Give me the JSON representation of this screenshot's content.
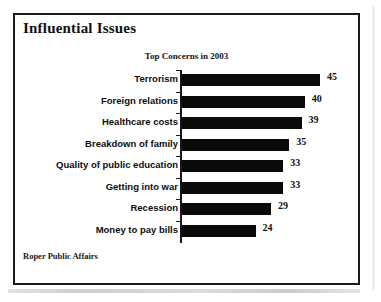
{
  "frame": {
    "panel_title": "Influential Issues",
    "source_note": "Roper Public Affairs"
  },
  "chart_data": {
    "type": "bar",
    "orientation": "horizontal",
    "title": "Top Concerns in 2003",
    "subtitle": "",
    "xlabel": "",
    "ylabel": "",
    "xlim": [
      0,
      50
    ],
    "grid": false,
    "legend": false,
    "value_labels": true,
    "bar_color": "#0a0a0a",
    "categories": [
      "Terrorism",
      "Foreign relations",
      "Healthcare costs",
      "Breakdown of family",
      "Quality of public education",
      "Getting into war",
      "Recession",
      "Money to pay bills"
    ],
    "values": [
      45,
      40,
      39,
      35,
      33,
      33,
      29,
      24
    ],
    "labels": [
      "45",
      "40",
      "39",
      "35",
      "33",
      "33",
      "29",
      "24"
    ]
  }
}
